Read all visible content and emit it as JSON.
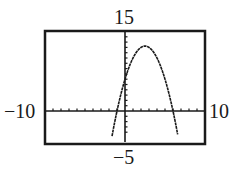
{
  "chart_data": {
    "type": "line",
    "title": "",
    "xlabel": "",
    "ylabel": "",
    "function": "y = -x^2 + 5x + 6",
    "series": [
      {
        "name": "parabola",
        "x": [
          -1.5,
          -1,
          0,
          1,
          2,
          2.5,
          3,
          4,
          5,
          6,
          6.5
        ],
        "values": [
          -3.75,
          0,
          6,
          10,
          12,
          12.25,
          12,
          10,
          6,
          0,
          -3.75
        ]
      }
    ],
    "key_points": {
      "vertex": [
        2.5,
        12.25
      ],
      "x_intercepts": [
        -1,
        6
      ],
      "y_intercept": 6
    },
    "xlim": [
      -10,
      10
    ],
    "ylim": [
      -5,
      15
    ],
    "xscale": 1,
    "yscale": 1,
    "grid": false,
    "legend": "none",
    "window_labels": {
      "xmin": "−10",
      "xmax": "10",
      "ymin": "−5",
      "ymax": "15"
    }
  },
  "colors": {
    "ink": "#1a1a1a",
    "background": "#ffffff"
  }
}
